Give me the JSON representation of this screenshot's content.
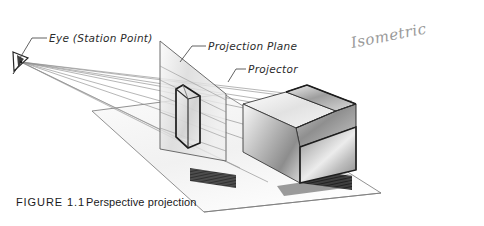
{
  "figure": {
    "caption_label": "FIGURE 1.1",
    "caption_text": "Perspective projection",
    "handwritten_note": "Isometric",
    "background_color": "#ffffff"
  },
  "callouts": [
    {
      "id": "eye",
      "label": "Eye (Station Point)"
    },
    {
      "id": "projection-plane",
      "label": "Projection Plane"
    },
    {
      "id": "projector",
      "label": "Projector"
    }
  ],
  "colors": {
    "ink": "#1c1c1c",
    "ray": "#8e8e8e",
    "leader": "#3a3a3a",
    "ground_plane": "#f2f2f2",
    "picture_plane": "#dcdcdc",
    "object_light": "#f5f5f5",
    "object_mid": "#b8b8b8",
    "object_dark": "#6a6a6a",
    "shadow": "#2c2c2c",
    "pencil": "#9a9a9a"
  },
  "elements": {
    "eye_symbol": "eye-station-point-marker",
    "ground_plane": "ground-plane",
    "picture_plane": "projection-plane-surface",
    "projected_image": "projected-house-outline",
    "object": "house-solid",
    "object_shadow": "house-shadow",
    "projected_shadow": "projected-image-shadow",
    "projector_rays": "projector-ray-bundle"
  }
}
